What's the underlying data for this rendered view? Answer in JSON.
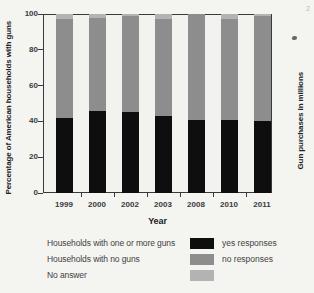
{
  "chart_data": {
    "type": "bar",
    "subtype": "stacked-vertical",
    "categories": [
      "1999",
      "2000",
      "2002",
      "2003",
      "2008",
      "2010",
      "2011"
    ],
    "series": [
      {
        "name": "yes responses",
        "legend_label": "Households with one or more guns",
        "color": "#0e0e0e",
        "values": [
          42,
          46,
          45,
          43,
          41,
          41,
          40
        ]
      },
      {
        "name": "no responses",
        "legend_label": "Households with no guns",
        "color": "#8d8d8d",
        "values": [
          55,
          52,
          54,
          54,
          59,
          56,
          59
        ]
      },
      {
        "name": "no answer",
        "legend_label": "No answer",
        "color": "#b3b3b3",
        "values": [
          3,
          2,
          1,
          3,
          0,
          3,
          1
        ]
      }
    ],
    "stack_order_bottom_to_top": [
      "yes responses",
      "no responses",
      "no answer"
    ],
    "title": "",
    "xlabel": "Year",
    "ylabel_left": "Percentage of American households with guns",
    "ylabel_right": "Gun purchases in millions",
    "yticks": [
      0,
      20,
      40,
      60,
      80,
      100
    ],
    "ylim": [
      0,
      100
    ],
    "grid": false,
    "legend_position": "bottom"
  },
  "axes": {
    "xlabel": "Year",
    "ylabel_left": "Percentage of American households with guns",
    "ylabel_right": "Gun purchases in millions"
  },
  "legend": {
    "rows": [
      {
        "label": "Households with one or more guns",
        "response": "yes responses",
        "color": "#0e0e0e"
      },
      {
        "label": "Households with no guns",
        "response": "no responses",
        "color": "#8d8d8d"
      },
      {
        "label": "No answer",
        "response": "",
        "color": "#b3b3b3"
      }
    ]
  },
  "artifacts": {
    "corner_mark": "2"
  }
}
